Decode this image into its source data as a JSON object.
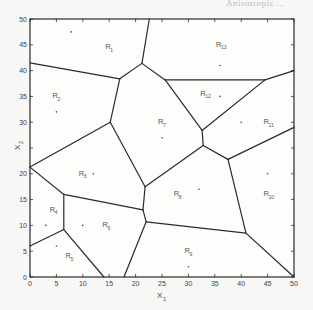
{
  "figure": {
    "title_fragment": "Anisotropic ...",
    "xlabel": "X",
    "xlabel_sub": "1",
    "ylabel": "X",
    "ylabel_sub": "2",
    "xticks": [
      0,
      5,
      10,
      15,
      20,
      25,
      30,
      35,
      40,
      45,
      50
    ],
    "yticks": [
      0,
      5,
      10,
      15,
      20,
      25,
      30,
      35,
      40,
      45,
      50
    ],
    "xlim": [
      0,
      50
    ],
    "ylim": [
      0,
      50
    ]
  },
  "chart_data": {
    "type": "voronoi-diagram",
    "title": "",
    "xlabel": "X1",
    "ylabel": "X2",
    "xlim": [
      0,
      50
    ],
    "ylim": [
      0,
      50
    ],
    "grid": false,
    "regions": [
      {
        "label": "R",
        "sub": "1",
        "seed": [
          7.8,
          47.5
        ],
        "label_pos": [
          15,
          44.5
        ]
      },
      {
        "label": "R",
        "sub": "2",
        "seed": [
          5,
          32
        ],
        "label_pos": [
          5,
          35
        ]
      },
      {
        "label": "R",
        "sub": "3",
        "seed": [
          12,
          20
        ],
        "label_pos": [
          10,
          20
        ]
      },
      {
        "label": "R",
        "sub": "4",
        "seed": [
          3,
          10
        ],
        "label_pos": [
          4.5,
          13
        ]
      },
      {
        "label": "R",
        "sub": "5",
        "seed": [
          5,
          6
        ],
        "label_pos": [
          7.5,
          4
        ]
      },
      {
        "label": "R",
        "sub": "6",
        "seed": [
          10,
          10
        ],
        "label_pos": [
          14.5,
          10
        ]
      },
      {
        "label": "R",
        "sub": "7",
        "seed": [
          25,
          27
        ],
        "label_pos": [
          25,
          30
        ]
      },
      {
        "label": "R",
        "sub": "8",
        "seed": [
          32,
          17
        ],
        "label_pos": [
          28,
          16
        ]
      },
      {
        "label": "R",
        "sub": "9",
        "seed": [
          30,
          2
        ],
        "label_pos": [
          30,
          5
        ]
      },
      {
        "label": "R",
        "sub": "10",
        "seed": [
          45,
          20
        ],
        "label_pos": [
          45,
          16
        ]
      },
      {
        "label": "R",
        "sub": "11",
        "seed": [
          40,
          30
        ],
        "label_pos": [
          45,
          30
        ]
      },
      {
        "label": "R",
        "sub": "12",
        "seed": [
          36,
          35
        ],
        "label_pos": [
          33,
          35.5
        ]
      },
      {
        "label": "R",
        "sub": "13",
        "seed": [
          36,
          41
        ],
        "label_pos": [
          36,
          45
        ]
      }
    ],
    "edges": [
      [
        [
          0,
          41.5
        ],
        [
          17,
          38.4
        ]
      ],
      [
        [
          17,
          38.4
        ],
        [
          21.2,
          41.4
        ]
      ],
      [
        [
          21.2,
          41.4
        ],
        [
          22.6,
          50
        ]
      ],
      [
        [
          21.2,
          41.4
        ],
        [
          25.6,
          38.2
        ]
      ],
      [
        [
          25.6,
          38.2
        ],
        [
          44.5,
          38.2
        ]
      ],
      [
        [
          44.5,
          38.2
        ],
        [
          50,
          40
        ]
      ],
      [
        [
          17,
          38.4
        ],
        [
          15.2,
          30
        ]
      ],
      [
        [
          15.2,
          30
        ],
        [
          0,
          21.3
        ]
      ],
      [
        [
          0,
          21.3
        ],
        [
          6.4,
          16
        ]
      ],
      [
        [
          15.2,
          30
        ],
        [
          21.8,
          17.5
        ]
      ],
      [
        [
          6.4,
          16
        ],
        [
          21.4,
          13
        ]
      ],
      [
        [
          6.4,
          16
        ],
        [
          6.4,
          9.2
        ]
      ],
      [
        [
          6.4,
          9.2
        ],
        [
          0,
          6
        ]
      ],
      [
        [
          6.4,
          9.2
        ],
        [
          14,
          0
        ]
      ],
      [
        [
          21.8,
          17.5
        ],
        [
          21.4,
          13
        ]
      ],
      [
        [
          21.4,
          13
        ],
        [
          22,
          10.7
        ]
      ],
      [
        [
          22,
          10.7
        ],
        [
          17.8,
          0
        ]
      ],
      [
        [
          22,
          10.7
        ],
        [
          40.9,
          8.5
        ]
      ],
      [
        [
          40.9,
          8.5
        ],
        [
          50,
          0
        ]
      ],
      [
        [
          21.8,
          17.5
        ],
        [
          32.8,
          25.5
        ]
      ],
      [
        [
          25.6,
          38.2
        ],
        [
          32.6,
          28.4
        ]
      ],
      [
        [
          32.6,
          28.4
        ],
        [
          44.5,
          38.2
        ]
      ],
      [
        [
          32.6,
          28.4
        ],
        [
          32.8,
          25.5
        ]
      ],
      [
        [
          32.8,
          25.5
        ],
        [
          37.5,
          22.8
        ]
      ],
      [
        [
          37.5,
          22.8
        ],
        [
          50,
          29
        ]
      ],
      [
        [
          37.5,
          22.8
        ],
        [
          40.9,
          8.5
        ]
      ]
    ]
  }
}
